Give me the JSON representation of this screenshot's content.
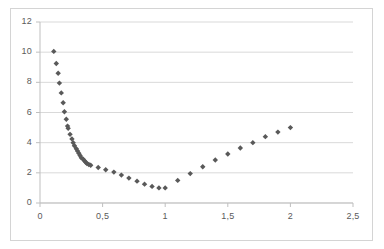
{
  "chart_data": {
    "type": "scatter",
    "title": "",
    "xlabel": "",
    "ylabel": "",
    "xlim": [
      0,
      2.5
    ],
    "ylim": [
      0,
      12
    ],
    "grid": true,
    "legend": false,
    "marker": "diamond",
    "marker_color": "#595959",
    "gridline_color": "#d9d9d9",
    "axis_color": "#bfbfbf",
    "decimal_separator": ",",
    "x_ticks": [
      0,
      0.5,
      1,
      1.5,
      2,
      2.5
    ],
    "x_tick_labels": [
      "0",
      "0,5",
      "1",
      "1,5",
      "2",
      "2,5"
    ],
    "y_ticks": [
      0,
      2,
      4,
      6,
      8,
      10,
      12
    ],
    "y_tick_labels": [
      "0",
      "2",
      "4",
      "6",
      "8",
      "10",
      "12"
    ],
    "points": [
      [
        0.11,
        10.05
      ],
      [
        0.13,
        9.25
      ],
      [
        0.145,
        8.6
      ],
      [
        0.155,
        7.95
      ],
      [
        0.17,
        7.3
      ],
      [
        0.185,
        6.65
      ],
      [
        0.195,
        6.05
      ],
      [
        0.21,
        5.55
      ],
      [
        0.22,
        5.1
      ],
      [
        0.225,
        4.95
      ],
      [
        0.24,
        4.55
      ],
      [
        0.255,
        4.25
      ],
      [
        0.265,
        4.0
      ],
      [
        0.275,
        3.8
      ],
      [
        0.29,
        3.6
      ],
      [
        0.3,
        3.45
      ],
      [
        0.31,
        3.3
      ],
      [
        0.32,
        3.15
      ],
      [
        0.33,
        3.0
      ],
      [
        0.345,
        2.9
      ],
      [
        0.355,
        2.8
      ],
      [
        0.365,
        2.7
      ],
      [
        0.375,
        2.62
      ],
      [
        0.39,
        2.55
      ],
      [
        0.405,
        2.5
      ],
      [
        0.465,
        2.35
      ],
      [
        0.525,
        2.2
      ],
      [
        0.59,
        2.05
      ],
      [
        0.65,
        1.85
      ],
      [
        0.71,
        1.65
      ],
      [
        0.775,
        1.45
      ],
      [
        0.835,
        1.25
      ],
      [
        0.895,
        1.1
      ],
      [
        0.95,
        1.0
      ],
      [
        1.0,
        1.0
      ],
      [
        1.1,
        1.5
      ],
      [
        1.2,
        1.95
      ],
      [
        1.3,
        2.4
      ],
      [
        1.4,
        2.85
      ],
      [
        1.5,
        3.25
      ],
      [
        1.6,
        3.65
      ],
      [
        1.7,
        4.0
      ],
      [
        1.8,
        4.4
      ],
      [
        1.9,
        4.7
      ],
      [
        2.0,
        5.0
      ]
    ]
  }
}
